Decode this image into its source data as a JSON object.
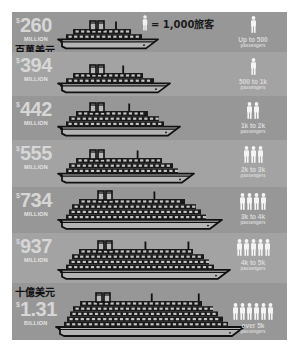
{
  "legend": {
    "icon": "person-icon",
    "text": "= 1,000旅客"
  },
  "labels": {
    "million_cn": "百萬美元",
    "billion_cn": "十億美元"
  },
  "rows": [
    {
      "dollar": "$",
      "value": "260",
      "unit": "MILLION",
      "range": "Up to 500",
      "pax": "passengers",
      "people": 1,
      "funnels": 2,
      "masts": 1,
      "decks": 2,
      "length": 100
    },
    {
      "dollar": "$",
      "value": "394",
      "unit": "MILLION",
      "range": "500 to 1k",
      "pax": "passengers",
      "people": 1,
      "funnels": 2,
      "masts": 1,
      "decks": 2,
      "length": 112
    },
    {
      "dollar": "$",
      "value": "442",
      "unit": "MILLION",
      "range": "1k to 2k",
      "pax": "passengers",
      "people": 2,
      "funnels": 2,
      "masts": 1,
      "decks": 3,
      "length": 122
    },
    {
      "dollar": "$",
      "value": "555",
      "unit": "MILLION",
      "range": "2k to 3k",
      "pax": "passengers",
      "people": 3,
      "funnels": 2,
      "masts": 1,
      "decks": 3,
      "length": 136
    },
    {
      "dollar": "$",
      "value": "734",
      "unit": "MILLION",
      "range": "3k to 4k",
      "pax": "passengers",
      "people": 4,
      "funnels": 2,
      "masts": 1,
      "decks": 4,
      "length": 164
    },
    {
      "dollar": "$",
      "value": "937",
      "unit": "MILLION",
      "range": "4k to 5k",
      "pax": "passengers",
      "people": 5,
      "funnels": 2,
      "masts": 2,
      "decks": 4,
      "length": 172
    },
    {
      "dollar": "$",
      "value": "1.31",
      "unit": "BILLION",
      "range": "over 5k",
      "pax": "passengers",
      "people": 6,
      "funnels": 2,
      "masts": 2,
      "decks": 5,
      "length": 188
    }
  ],
  "colors": {
    "panel": "#9a9a9a",
    "row_alt": "#a3a3a3",
    "ship_stroke": "#111111",
    "text_light": "#d6d6d6"
  },
  "chart_data": {
    "type": "bar",
    "categories": [
      "Up to 500",
      "500 to 1k",
      "1k to 2k",
      "2k to 3k",
      "3k to 4k",
      "4k to 5k",
      "over 5k"
    ],
    "series": [
      {
        "name": "Cost (USD millions)",
        "values": [
          260,
          394,
          442,
          555,
          734,
          937,
          1310
        ]
      },
      {
        "name": "Passenger icons (1 icon = 1,000 passengers)",
        "values": [
          1,
          1,
          2,
          3,
          4,
          5,
          6
        ]
      }
    ],
    "xlabel": "passengers",
    "ylabel": "Cost",
    "legend": "1 icon = 1,000旅客",
    "annotations": [
      "百萬美元",
      "十億美元"
    ],
    "grid": false
  }
}
